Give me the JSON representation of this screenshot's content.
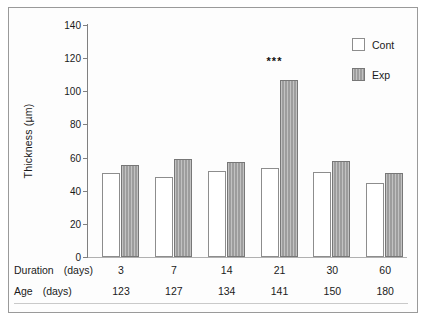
{
  "chart_data": {
    "type": "bar",
    "title": "",
    "xlabel": "",
    "ylabel": "Thickness (µm)",
    "ylim": [
      0,
      140
    ],
    "yticks": [
      0,
      20,
      40,
      60,
      80,
      100,
      120,
      140
    ],
    "grid": false,
    "legend_position": "top-right",
    "categories": [
      "3",
      "7",
      "14",
      "21",
      "30",
      "60"
    ],
    "series": [
      {
        "name": "Cont",
        "values": [
          50.7,
          48.3,
          52.0,
          53.7,
          51.3,
          44.8
        ],
        "color": "#ffffff"
      },
      {
        "name": "Exp",
        "values": [
          55.5,
          59.1,
          57.5,
          106.8,
          58.0,
          50.7
        ],
        "color": "#9d9d9d"
      }
    ],
    "annotations": [
      {
        "category": "21",
        "series": "Exp",
        "text": "***",
        "y": 118
      }
    ],
    "axis_color": "#808080"
  },
  "legend": {
    "items": [
      {
        "label": "Cont",
        "swatch": "open-square"
      },
      {
        "label": "Exp",
        "swatch": "filled-square"
      }
    ]
  },
  "table": {
    "rows": [
      {
        "header": "Duration",
        "unit": "(days)",
        "values": [
          "3",
          "7",
          "14",
          "21",
          "30",
          "60"
        ]
      },
      {
        "header": "Age",
        "unit": "(days)",
        "values": [
          "123",
          "127",
          "134",
          "141",
          "150",
          "180"
        ]
      }
    ]
  }
}
